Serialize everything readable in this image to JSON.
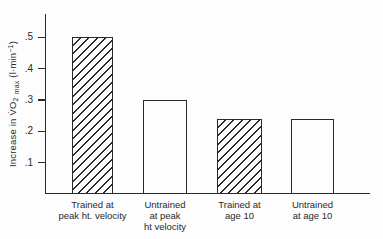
{
  "figure": {
    "ink": "#2a2a2a",
    "background": "#fdfdfd"
  },
  "y_axis": {
    "label_parts": {
      "prefix": "Increase in ",
      "v": "V̇",
      "o": "O",
      "o_sub": "2",
      "max_sub": "max",
      "unit_pre": " (l·min",
      "unit_sup": "−1",
      "unit_post": ")"
    }
  },
  "chart_data": {
    "type": "bar",
    "title": "",
    "xlabel": "",
    "ylabel": "Increase in V̇O₂ max (l·min⁻¹)",
    "ylim": [
      0,
      0.575
    ],
    "yticks": [
      0.1,
      0.2,
      0.3,
      0.4,
      0.5
    ],
    "ytick_labels": [
      ".1",
      ".2",
      ".3",
      ".4",
      ".5"
    ],
    "grid": false,
    "legend": false,
    "categories": [
      "Trained at peak ht. velocity",
      "Untrained at peak ht velocity",
      "Trained at age 10",
      "Untrained at age 10"
    ],
    "category_lines": [
      [
        "Trained at",
        "peak ht. velocity"
      ],
      [
        "Untrained",
        "at peak",
        "ht velocity"
      ],
      [
        "Trained at",
        "age 10"
      ],
      [
        "Untrained",
        "at age 10"
      ]
    ],
    "values": [
      0.5,
      0.3,
      0.24,
      0.24
    ],
    "bar_fill": [
      "hatched",
      "plain",
      "hatched",
      "plain"
    ]
  }
}
